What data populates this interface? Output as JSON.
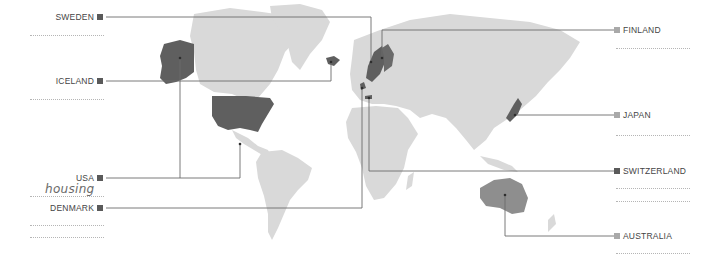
{
  "colors": {
    "land": "#d9d9d9",
    "highlight": "#5f5f5f",
    "highlight_light": "#8e8e8e",
    "connector": "#6b6b6b",
    "square_dark": "#5a5a5a",
    "square_light": "#a9a9a9"
  },
  "left_labels": [
    {
      "name": "SWEDEN",
      "square": "dark"
    },
    {
      "name": "ICELAND",
      "square": "dark"
    },
    {
      "name": "USA",
      "square": "dark"
    },
    {
      "name": "DENMARK",
      "square": "dark"
    }
  ],
  "right_labels": [
    {
      "name": "FINLAND",
      "square": "light"
    },
    {
      "name": "JAPAN",
      "square": "light"
    },
    {
      "name": "SWITZERLAND",
      "square": "dark"
    },
    {
      "name": "AUSTRALIA",
      "square": "light"
    }
  ],
  "annotations": {
    "usa_note": "housing"
  }
}
